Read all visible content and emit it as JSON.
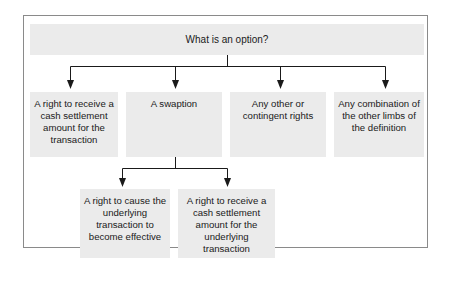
{
  "diagram": {
    "root": {
      "label": "What is an option?"
    },
    "level1": [
      {
        "label": "A right to receive a cash settlement amount for the transaction"
      },
      {
        "label": "A swaption"
      },
      {
        "label": "Any other or contingent rights"
      },
      {
        "label": "Any combination of the other limbs of the definition"
      }
    ],
    "swaption_children": [
      {
        "label": "A right to cause the underlying transaction to become effective"
      },
      {
        "label": "A right to receive a cash settlement amount for the underlying transaction"
      }
    ]
  },
  "colors": {
    "box_fill": "#ebebeb",
    "frame_border": "#8a8a8a",
    "connector": "#1a1a1a"
  }
}
